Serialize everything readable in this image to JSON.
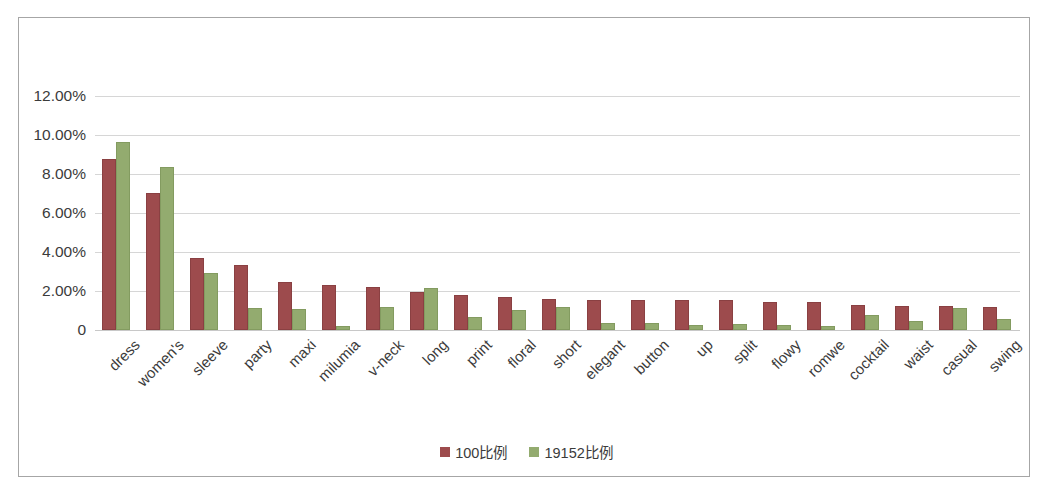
{
  "chart_data": {
    "type": "bar",
    "title": "",
    "xlabel": "",
    "ylabel": "",
    "ylim": [
      0,
      12
    ],
    "grid": true,
    "legend_position": "bottom",
    "ytick_labels": [
      "12.00%",
      "10.00%",
      "8.00%",
      "6.00%",
      "4.00%",
      "2.00%",
      "0"
    ],
    "ytick_values": [
      12,
      10,
      8,
      6,
      4,
      2,
      0
    ],
    "categories": [
      "dress",
      "women's",
      "sleeve",
      "party",
      "maxi",
      "milumia",
      "v-neck",
      "long",
      "print",
      "floral",
      "short",
      "elegant",
      "button",
      "up",
      "split",
      "flowy",
      "romwe",
      "cocktail",
      "waist",
      "casual",
      "swing"
    ],
    "series": [
      {
        "name": "100比例",
        "color": "#9d4b4d",
        "values": [
          8.65,
          6.9,
          3.6,
          3.25,
          2.35,
          2.2,
          2.1,
          1.85,
          1.7,
          1.6,
          1.5,
          1.42,
          1.42,
          1.42,
          1.42,
          1.35,
          1.35,
          1.2,
          1.15,
          1.12,
          1.1
        ]
      },
      {
        "name": "19152比例",
        "color": "#93ab6f",
        "values": [
          9.55,
          8.25,
          2.8,
          1.05,
          1.0,
          0.1,
          1.1,
          2.05,
          0.55,
          0.9,
          1.1,
          0.28,
          0.25,
          0.18,
          0.22,
          0.15,
          0.08,
          0.65,
          0.35,
          1.02,
          0.48
        ]
      }
    ]
  },
  "legend": {
    "items": [
      {
        "label": "100比例",
        "color": "#9d4b4d"
      },
      {
        "label": "19152比例",
        "color": "#93ab6f"
      }
    ]
  },
  "colors": {
    "series_1": "#9d4b4d",
    "series_2": "#93ab6f",
    "gridline": "#d6d6d6",
    "frame_border": "#a6a6a6",
    "text": "#3b3b3b",
    "background": "#ffffff"
  }
}
